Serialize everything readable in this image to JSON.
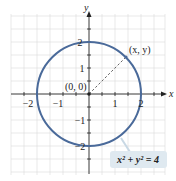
{
  "figure": {
    "type": "circle-diagram",
    "equation_label": "x² + y² = 4",
    "equation_parts": {
      "x": "x",
      "y": "y",
      "exp": "2",
      "plus": "+",
      "eq": "= 4"
    },
    "origin_label": "(0, 0)",
    "point_label": "(x, y)",
    "axis_x_label": "x",
    "axis_y_label": "y",
    "x_ticks": [
      "−2",
      "−1",
      "1",
      "2"
    ],
    "y_ticks": [
      "2",
      "1",
      "−1",
      "−2"
    ],
    "radius": 2,
    "colors": {
      "circle": "#4a6a9a",
      "grid": "#d8d8d8",
      "axis": "#222222",
      "callout_bg": "#dfe9f0"
    }
  }
}
